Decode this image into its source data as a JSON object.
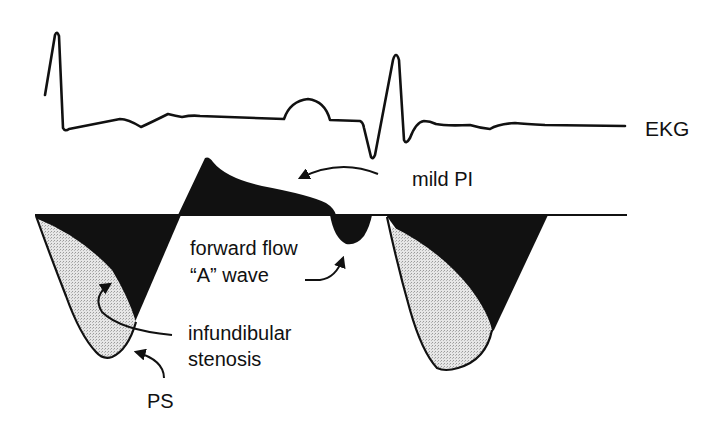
{
  "diagram": {
    "colors": {
      "ink": "#111111",
      "background": "#ffffff",
      "stipple_fill": "#d9d9d9"
    },
    "traces": [
      {
        "id": "ekg",
        "label": "EKG"
      },
      {
        "id": "doppler",
        "label": "Doppler flow baseline"
      }
    ],
    "labels": {
      "ekg": "EKG",
      "mild_pi": "mild PI",
      "forward_flow_line1": "forward flow",
      "forward_flow_line2": "“A” wave",
      "infundibular_line1": "infundibular",
      "infundibular_line2": "stenosis",
      "ps": "PS"
    },
    "annotations": [
      {
        "text": "mild PI",
        "points_to": "diastolic regurgitant flow above baseline"
      },
      {
        "text": "forward flow “A” wave",
        "points_to": "small late-diastolic dip below baseline"
      },
      {
        "text": "infundibular stenosis",
        "points_to": "inner stippled dagger-shaped envelope"
      },
      {
        "text": "PS",
        "points_to": "outer systolic jet envelope"
      }
    ]
  }
}
